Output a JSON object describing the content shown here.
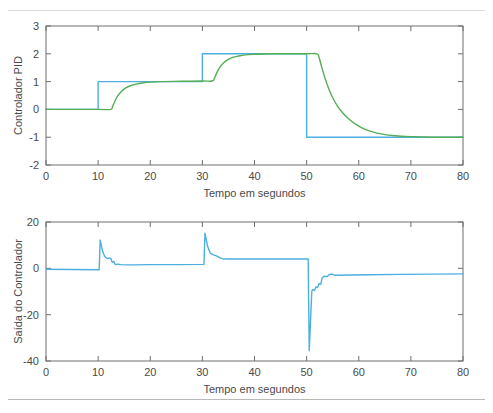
{
  "figure": {
    "background": "#ffffff",
    "axis_color": "#6e6e6e",
    "text_color": "#4a4a4a"
  },
  "chart_data": [
    {
      "id": "pid",
      "type": "line",
      "title": "",
      "xlabel": "Tempo em segundos",
      "ylabel": "Controlador PID",
      "xlim": [
        0,
        80
      ],
      "ylim": [
        -2,
        3
      ],
      "xticks": [
        0,
        10,
        20,
        30,
        40,
        50,
        60,
        70,
        80
      ],
      "xticklabels": [
        "0",
        "10",
        "20",
        "30",
        "40",
        "50",
        "60",
        "70",
        "80"
      ],
      "yticks": [
        -2,
        -1,
        0,
        1,
        2,
        3
      ],
      "yticklabels": [
        "-2",
        "-1",
        "0",
        "1",
        "2",
        "3"
      ],
      "grid": false,
      "legend": "none",
      "series": [
        {
          "name": "Referencia",
          "color": "#4BAFE0",
          "style": "step",
          "points": [
            [
              0,
              0
            ],
            [
              10,
              0
            ],
            [
              10,
              1
            ],
            [
              30,
              1
            ],
            [
              30,
              2
            ],
            [
              50,
              2
            ],
            [
              50,
              -1
            ],
            [
              80,
              -1
            ]
          ]
        },
        {
          "name": "Resposta",
          "color": "#55AD55",
          "style": "smooth",
          "points": [
            [
              0,
              0
            ],
            [
              10,
              0
            ],
            [
              12.4,
              0
            ],
            [
              12.8,
              0.12
            ],
            [
              13.3,
              0.33
            ],
            [
              13.9,
              0.52
            ],
            [
              14.6,
              0.67
            ],
            [
              15.4,
              0.78
            ],
            [
              16.3,
              0.86
            ],
            [
              17.3,
              0.91
            ],
            [
              18.5,
              0.95
            ],
            [
              20,
              0.98
            ],
            [
              22,
              1.0
            ],
            [
              26,
              1.01
            ],
            [
              30,
              1.02
            ],
            [
              31.9,
              1.02
            ],
            [
              32.3,
              1.12
            ],
            [
              32.8,
              1.33
            ],
            [
              33.4,
              1.53
            ],
            [
              34.1,
              1.68
            ],
            [
              34.9,
              1.79
            ],
            [
              35.8,
              1.87
            ],
            [
              36.9,
              1.92
            ],
            [
              38.2,
              1.96
            ],
            [
              40,
              1.98
            ],
            [
              43,
              2.0
            ],
            [
              47,
              2.0
            ],
            [
              50,
              2.0
            ],
            [
              52,
              2.0
            ],
            [
              52.4,
              1.86
            ],
            [
              52.9,
              1.52
            ],
            [
              53.5,
              1.14
            ],
            [
              54.2,
              0.76
            ],
            [
              55,
              0.42
            ],
            [
              55.9,
              0.13
            ],
            [
              56.9,
              -0.12
            ],
            [
              58,
              -0.33
            ],
            [
              59.3,
              -0.52
            ],
            [
              60.8,
              -0.68
            ],
            [
              62.5,
              -0.8
            ],
            [
              64.5,
              -0.89
            ],
            [
              67,
              -0.95
            ],
            [
              70,
              -0.98
            ],
            [
              74,
              -1.0
            ],
            [
              80,
              -1.0
            ]
          ]
        }
      ]
    },
    {
      "id": "saida",
      "type": "line",
      "title": "",
      "xlabel": "Tempo em segundos",
      "ylabel": "Saída do Controlador",
      "xlim": [
        0,
        80
      ],
      "ylim": [
        -40,
        20
      ],
      "xticks": [
        0,
        10,
        20,
        30,
        40,
        50,
        60,
        70,
        80
      ],
      "xticklabels": [
        "0",
        "10",
        "20",
        "30",
        "40",
        "50",
        "60",
        "70",
        "80"
      ],
      "yticks": [
        -40,
        -20,
        0,
        20
      ],
      "yticklabels": [
        "-40",
        "-20",
        "0",
        "20"
      ],
      "grid": false,
      "legend": "none",
      "series": [
        {
          "name": "Saida do Controlador",
          "color": "#4BAFE0",
          "style": "line",
          "points": [
            [
              0,
              -0.4
            ],
            [
              10.2,
              -0.6
            ],
            [
              10.4,
              12.2
            ],
            [
              10.9,
              7.0
            ],
            [
              11.3,
              5.0
            ],
            [
              11.8,
              4.2
            ],
            [
              12.1,
              4.5
            ],
            [
              12.4,
              4.3
            ],
            [
              12.7,
              2.6
            ],
            [
              13.0,
              3.0
            ],
            [
              13.3,
              1.6
            ],
            [
              13.8,
              1.8
            ],
            [
              14.4,
              1.6
            ],
            [
              15.2,
              1.5
            ],
            [
              16.5,
              1.5
            ],
            [
              20,
              1.6
            ],
            [
              25,
              1.6
            ],
            [
              30.3,
              1.7
            ],
            [
              30.5,
              15.2
            ],
            [
              31.0,
              9.5
            ],
            [
              31.5,
              6.6
            ],
            [
              32.0,
              5.9
            ],
            [
              32.4,
              5.6
            ],
            [
              32.8,
              5.3
            ],
            [
              33.3,
              4.6
            ],
            [
              33.9,
              4.1
            ],
            [
              34.6,
              4.0
            ],
            [
              36,
              4.0
            ],
            [
              40,
              4.0
            ],
            [
              45,
              4.0
            ],
            [
              50.3,
              4.0
            ],
            [
              50.5,
              -35.6
            ],
            [
              50.8,
              -20.0
            ],
            [
              51.0,
              -9.8
            ],
            [
              51.2,
              -9.2
            ],
            [
              51.5,
              -9.6
            ],
            [
              51.8,
              -8.0
            ],
            [
              52.1,
              -8.3
            ],
            [
              52.4,
              -6.6
            ],
            [
              52.7,
              -6.9
            ],
            [
              53.0,
              -4.0
            ],
            [
              53.4,
              -3.4
            ],
            [
              53.9,
              -3.6
            ],
            [
              54.4,
              -2.6
            ],
            [
              54.9,
              -2.5
            ],
            [
              55.5,
              -3.0
            ],
            [
              56.3,
              -3.0
            ],
            [
              58,
              -2.9
            ],
            [
              62,
              -2.8
            ],
            [
              68,
              -2.6
            ],
            [
              74,
              -2.5
            ],
            [
              80,
              -2.4
            ]
          ]
        }
      ]
    }
  ]
}
